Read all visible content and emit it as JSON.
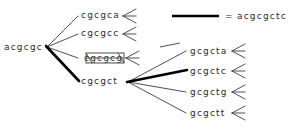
{
  "diagram": {
    "type": "sequence-expansion-tree",
    "root": {
      "label": "acgcgc",
      "x": 4,
      "y": 47
    },
    "level1": [
      {
        "label": "cgcgca",
        "x": 81,
        "y": 15,
        "highlighted": false,
        "struck": false
      },
      {
        "label": "cgcgcc",
        "x": 81,
        "y": 33,
        "highlighted": false,
        "struck": false
      },
      {
        "label": "cgcgcg",
        "x": 81,
        "y": 58,
        "highlighted": false,
        "struck": true
      },
      {
        "label": "cgcgct",
        "x": 81,
        "y": 81,
        "highlighted": true,
        "struck": false
      }
    ],
    "level2": [
      {
        "label": "gcgcta",
        "x": 190,
        "y": 51,
        "highlighted": false
      },
      {
        "label": "gcgctc",
        "x": 190,
        "y": 71,
        "highlighted": true
      },
      {
        "label": "gcgctg",
        "x": 190,
        "y": 92,
        "highlighted": false
      },
      {
        "label": "gcgctt",
        "x": 190,
        "y": 113,
        "highlighted": false
      }
    ],
    "legend": {
      "swatch_name": "thick-line-swatch",
      "equals": "=",
      "sequence": "acgcgctc",
      "swatch_x1": 172,
      "swatch_x2": 219,
      "swatch_y": 16,
      "text_x": 225,
      "text_y": 16
    },
    "colors": {
      "ink": "#2b2b2b",
      "edge": "#3c3c3c",
      "highlight": "#000000",
      "background": "#ffffff"
    }
  }
}
